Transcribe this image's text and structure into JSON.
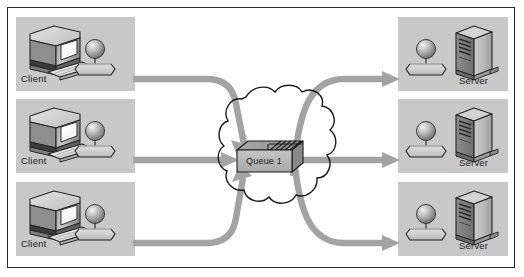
{
  "diagram": {
    "type": "network-topology",
    "background_color": "#ffffff",
    "border_color": "#2a2a2a",
    "group_box_color": "#c8c8c8",
    "arrow_color": "#a0a0a0",
    "cloud_color": "#ffffff",
    "cloud_outline_color": "#1a1a1a",
    "queue_face_color": "#b4b4b4",
    "queue_top_color": "#9a9a9a"
  },
  "clients": [
    {
      "label": "Client",
      "icon": "desktop-computer-icon"
    },
    {
      "label": "Client",
      "icon": "desktop-computer-icon"
    },
    {
      "label": "Client",
      "icon": "desktop-computer-icon"
    }
  ],
  "servers": [
    {
      "label": "Server",
      "icon": "server-tower-icon"
    },
    {
      "label": "Server",
      "icon": "server-tower-icon"
    },
    {
      "label": "Server",
      "icon": "server-tower-icon"
    }
  ],
  "queue": {
    "label": "Queue 1",
    "icon": "queue-box-icon"
  },
  "network": {
    "label": "",
    "icon": "cloud-icon"
  },
  "flows": [
    {
      "from": "Client",
      "to": "Queue 1",
      "direction": "in"
    },
    {
      "from": "Client",
      "to": "Queue 1",
      "direction": "in"
    },
    {
      "from": "Client",
      "to": "Queue 1",
      "direction": "in"
    },
    {
      "from": "Queue 1",
      "to": "Server",
      "direction": "out"
    },
    {
      "from": "Queue 1",
      "to": "Server",
      "direction": "out"
    },
    {
      "from": "Queue 1",
      "to": "Server",
      "direction": "out"
    }
  ]
}
